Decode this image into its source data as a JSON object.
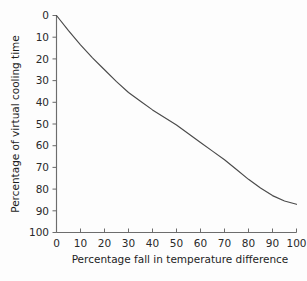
{
  "chart_data": {
    "type": "line",
    "title": "",
    "subtitle": "",
    "xlabel": "Percentage fall in temperature difference",
    "ylabel": "Percentage of virtual cooling time",
    "xlim": [
      0,
      100
    ],
    "ylim": [
      0,
      100
    ],
    "y_axis_inverted": true,
    "grid": false,
    "legend": null,
    "legend_position": "none",
    "xticks": [
      0,
      10,
      20,
      30,
      40,
      50,
      60,
      70,
      80,
      90,
      100
    ],
    "xtick_labels": [
      "0",
      "10",
      "20",
      "30",
      "40",
      "50",
      "60",
      "70",
      "80",
      "90",
      "100"
    ],
    "yticks": [
      0,
      10,
      20,
      30,
      40,
      50,
      60,
      70,
      80,
      90,
      100
    ],
    "ytick_labels": [
      "0",
      "10",
      "20",
      "30",
      "40",
      "50",
      "60",
      "70",
      "80",
      "90",
      "100"
    ],
    "series": [
      {
        "name": "virtual cooling time curve",
        "x": [
          0,
          5,
          10,
          15,
          20,
          25,
          30,
          35,
          40,
          45,
          50,
          55,
          60,
          65,
          70,
          75,
          80,
          85,
          90,
          95,
          100
        ],
        "values": [
          0,
          7,
          13.5,
          19.5,
          25,
          30.5,
          35.5,
          39.5,
          43.5,
          47,
          50.5,
          54.5,
          58.5,
          62.5,
          66.5,
          71,
          75.5,
          79.5,
          83,
          85.5,
          87
        ]
      }
    ],
    "annotations": [],
    "line_color": "#4a4a4a",
    "axis_color": "#6d6d6d",
    "background_color": "#fdfdfd"
  }
}
